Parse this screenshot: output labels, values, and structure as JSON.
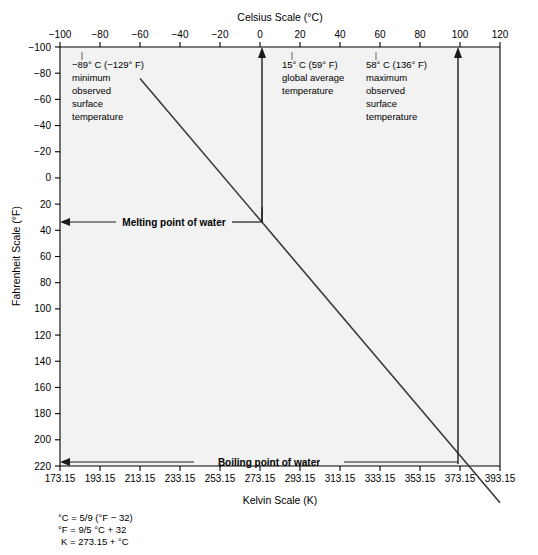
{
  "chart_data": {
    "type": "line",
    "title": "",
    "xlabel": "Celsius Scale (°C)",
    "xlabel_bottom": "Kelvin Scale (K)",
    "ylabel": "Fahrenheit Scale (°F)",
    "x_axis_position": "top",
    "y_axis_inverted": true,
    "grid": false,
    "legend": "none",
    "xlim_celsius": [
      -100,
      120
    ],
    "xlim_kelvin": [
      173.15,
      393.15
    ],
    "ylim_fahrenheit": [
      -100,
      220
    ],
    "x_ticks_celsius": [
      "−100",
      "−80",
      "−60",
      "−40",
      "−20",
      "0",
      "20",
      "40",
      "60",
      "80",
      "100",
      "120"
    ],
    "x_ticks_celsius_values": [
      -100,
      -80,
      -60,
      -40,
      -20,
      0,
      20,
      40,
      60,
      80,
      100,
      120
    ],
    "x_ticks_kelvin": [
      "173.15",
      "193.15",
      "213.15",
      "233.15",
      "253.15",
      "273.15",
      "293.15",
      "313.15",
      "333.15",
      "353.15",
      "373.15",
      "393.15"
    ],
    "x_ticks_kelvin_values": [
      173.15,
      193.15,
      213.15,
      233.15,
      253.15,
      273.15,
      293.15,
      313.15,
      333.15,
      353.15,
      373.15,
      393.15
    ],
    "y_ticks_fahrenheit": [
      "−100",
      "−80",
      "−60",
      "−40",
      "−20",
      "0",
      "20",
      "40",
      "60",
      "80",
      "100",
      "120",
      "140",
      "160",
      "180",
      "200",
      "220"
    ],
    "y_ticks_fahrenheit_values": [
      -100,
      -80,
      -60,
      -40,
      -20,
      0,
      20,
      40,
      60,
      80,
      100,
      120,
      140,
      160,
      180,
      200,
      220
    ],
    "series": [
      {
        "name": "Celsius to Fahrenheit conversion",
        "points": [
          {
            "celsius": -60,
            "fahrenheit": -76
          },
          {
            "celsius": 0,
            "fahrenheit": 32
          },
          {
            "celsius": 100,
            "fahrenheit": 212
          },
          {
            "celsius": 120,
            "fahrenheit": 248
          }
        ]
      }
    ],
    "markers": [
      {
        "name": "minimum-observed",
        "celsius": -89,
        "fahrenheit": -129
      },
      {
        "name": "global-average",
        "celsius": 15,
        "fahrenheit": 59
      },
      {
        "name": "maximum-observed",
        "celsius": 58,
        "fahrenheit": 136
      },
      {
        "name": "melting-point-of-water",
        "celsius": 0,
        "fahrenheit": 32
      },
      {
        "name": "boiling-point-of-water",
        "celsius": 100,
        "fahrenheit": 212
      }
    ]
  },
  "annotations": {
    "min_temp": {
      "line1": "−89° C (−129° F)",
      "line2": "minimum",
      "line3": "observed",
      "line4": "surface",
      "line5": "temperature"
    },
    "avg_temp": {
      "line1": "15° C (59° F)",
      "line2": "global average",
      "line3": "temperature"
    },
    "max_temp": {
      "line1": "58° C (136° F)",
      "line2": "maximum",
      "line3": "observed",
      "line4": "surface",
      "line5": "temperature"
    },
    "melting_point": "Melting point of water",
    "boiling_point": "Boiling point of water"
  },
  "formulas": {
    "line1": "°C = 5/9 (°F − 32)",
    "line2": "°F = 9/5 °C + 32",
    "line3": "K = 273.15 + °C"
  },
  "colors": {
    "plot_background": "#f2f2f2",
    "axis": "#000000",
    "data_line": "#3a3a3a",
    "annotation": "#1a1a1a"
  }
}
